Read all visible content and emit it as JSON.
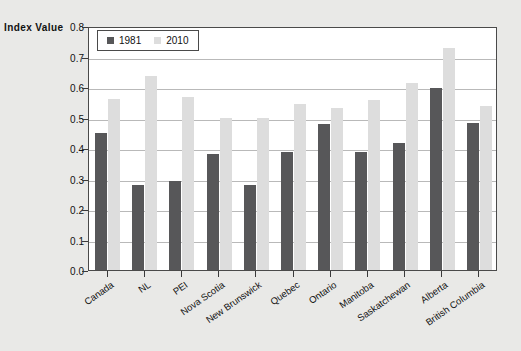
{
  "chart_data": {
    "type": "bar",
    "title": "",
    "xlabel": "",
    "ylabel": "Index Value",
    "ylim": [
      0.0,
      0.8
    ],
    "yticks": [
      "0.0",
      "0.1",
      "0.2",
      "0.3",
      "0.4",
      "0.5",
      "0.6",
      "0.7",
      "0.8"
    ],
    "grid": true,
    "legend_position": "top-left-inside",
    "categories": [
      "Canada",
      "NL",
      "PEI",
      "Nova Scotia",
      "New Brunswick",
      "Quebec",
      "Ontario",
      "Manitoba",
      "Saskatchewan",
      "Alberta",
      "British Columbia"
    ],
    "series": [
      {
        "name": "1981",
        "color": "#575759",
        "values": [
          0.448,
          0.278,
          0.292,
          0.38,
          0.28,
          0.386,
          0.478,
          0.388,
          0.418,
          0.598,
          0.483
        ]
      },
      {
        "name": "2010",
        "color": "#dddddd",
        "values": [
          0.56,
          0.637,
          0.567,
          0.497,
          0.497,
          0.545,
          0.532,
          0.558,
          0.613,
          0.727,
          0.537
        ]
      }
    ]
  },
  "legend": {
    "entries": [
      {
        "label": "1981",
        "swatch": "#575759"
      },
      {
        "label": "2010",
        "swatch": "#dddddd"
      }
    ]
  },
  "colors": {
    "page_background": "#e9e9e7",
    "plot_background": "#ffffff",
    "axis": "#4a4a4a",
    "gridline": "#b9b9b9",
    "series_1981": "#575759",
    "series_2010": "#dddddd"
  }
}
